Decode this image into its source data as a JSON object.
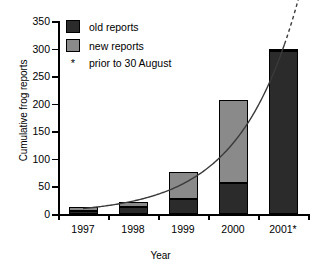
{
  "chart_data": {
    "type": "bar",
    "title": "",
    "xlabel": "Year",
    "ylabel": "Cumulative frog reports",
    "categories": [
      "1997",
      "1998",
      "1999",
      "2000",
      "2001*"
    ],
    "ylim": [
      0,
      350
    ],
    "yticks": [
      0,
      50,
      100,
      150,
      200,
      250,
      300,
      350
    ],
    "ytick_labels": [
      "0",
      "50",
      "100",
      "150",
      "200",
      "250",
      "300",
      "350"
    ],
    "grid": false,
    "stacked": true,
    "legend_position": "upper-left-inside",
    "series": [
      {
        "name": "old reports",
        "color": "#2b2b2b",
        "values": [
          5,
          12,
          27,
          57,
          295
        ]
      },
      {
        "name": "new reports",
        "color": "#8a8a8a",
        "values": [
          8,
          10,
          49,
          150,
          5
        ]
      }
    ],
    "totals": [
      13,
      22,
      76,
      207,
      300
    ],
    "annotations": [
      {
        "text": "* prior to 30 August",
        "kind": "footnote"
      }
    ],
    "overlay_curve": {
      "name": "exponential trend",
      "style": "solid with dashed extrapolation",
      "color": "#3a3a3a",
      "points": [
        {
          "x": 0,
          "y": 10
        },
        {
          "x": 1,
          "y": 22
        },
        {
          "x": 2,
          "y": 55
        },
        {
          "x": 3,
          "y": 140
        },
        {
          "x": 4,
          "y": 300
        }
      ],
      "dashed_beyond_y": 315
    }
  },
  "legend": {
    "items": [
      {
        "label": "old reports",
        "swatch": "dark-square"
      },
      {
        "label": "new reports",
        "swatch": "grey-square"
      }
    ],
    "note_marker": "*",
    "note_text": "prior to 30 August"
  },
  "axes": {
    "x_title": "Year",
    "y_title": "Cumulative frog reports"
  }
}
